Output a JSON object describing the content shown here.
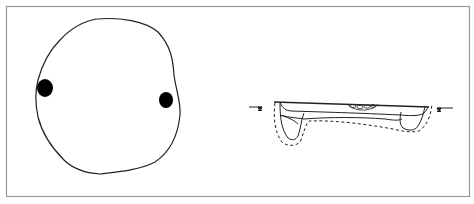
{
  "figure": {
    "type": "archaeological feature drawing",
    "panels": [
      {
        "name": "plan-view",
        "description": "Plan of oval pit outline with two filled post holes"
      },
      {
        "name": "section-view",
        "description": "Cross-section profile with fill layers, stone cluster and dashed excavation limit"
      }
    ],
    "colors": {
      "frame": "#9a9a9a",
      "line": "#222222",
      "fill_dark": "#000000",
      "background": "#ffffff"
    }
  }
}
